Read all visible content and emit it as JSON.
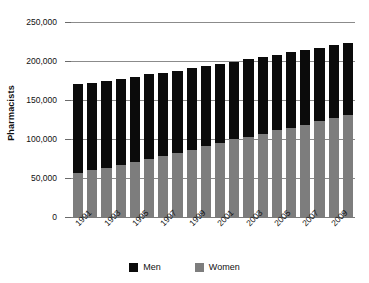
{
  "chart_data": {
    "type": "bar",
    "subtype": "stacked-vertical",
    "title": "",
    "xlabel": "",
    "ylabel": "Pharmacists",
    "ylim": [
      0,
      250000
    ],
    "ytick_values": [
      0,
      50000,
      100000,
      150000,
      200000,
      250000
    ],
    "ytick_labels": [
      "0",
      "50,000",
      "100,000",
      "150,000",
      "200,000",
      "250,000"
    ],
    "grid": true,
    "legend_position": "bottom-center",
    "categories": [
      "1991",
      "1992",
      "1993",
      "1994",
      "1995",
      "1996",
      "1997",
      "1998",
      "1999",
      "2000",
      "2001",
      "2002",
      "2003",
      "2004",
      "2005",
      "2006",
      "2007",
      "2008",
      "2009",
      "2010"
    ],
    "xtick_labels_shown": [
      "1991",
      "1993",
      "1995",
      "1997",
      "1999",
      "2001",
      "2003",
      "2005",
      "2007",
      "2009"
    ],
    "series": [
      {
        "name": "Women",
        "color": "#7d7d7d",
        "values": [
          57000,
          60000,
          63000,
          67000,
          71000,
          75000,
          78000,
          82000,
          86000,
          91000,
          95000,
          100000,
          103000,
          107000,
          111000,
          114000,
          118000,
          123000,
          127000,
          131000
        ]
      },
      {
        "name": "Men",
        "color": "#0b0b0b",
        "values": [
          114000,
          112000,
          111000,
          110000,
          108000,
          108000,
          107000,
          105000,
          105000,
          103000,
          101000,
          99000,
          100000,
          98000,
          97000,
          97000,
          96000,
          94000,
          93000,
          92000
        ]
      }
    ],
    "totals": [
      171000,
      172000,
      174000,
      177000,
      179000,
      183000,
      185000,
      187000,
      191000,
      194000,
      196000,
      199000,
      203000,
      205000,
      208000,
      211000,
      214000,
      217000,
      220000,
      223000
    ],
    "legend": [
      {
        "label": "Men",
        "color": "#0b0b0b"
      },
      {
        "label": "Women",
        "color": "#7d7d7d"
      }
    ]
  },
  "colors": {
    "men": "#0b0b0b",
    "women": "#7d7d7d",
    "grid": "#8b8b8b",
    "axis": "#6a6a6a",
    "text": "#111111",
    "background": "#ffffff"
  }
}
